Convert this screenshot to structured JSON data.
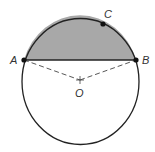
{
  "diagram": {
    "type": "circle-segment",
    "colors": {
      "stroke": "#222222",
      "segment_fill": "#a8a8a8",
      "label": "#333333",
      "background": "#ffffff"
    },
    "circle": {
      "cx": 80.5,
      "cy": 81.5,
      "rx": 58.5,
      "ry": 63
    },
    "points": {
      "A": {
        "label": "A",
        "x": 24,
        "y": 60
      },
      "B": {
        "label": "B",
        "x": 136,
        "y": 60
      },
      "C": {
        "label": "C",
        "x": 103,
        "y": 24
      },
      "O": {
        "label": "O",
        "x": 80,
        "y": 80
      }
    },
    "labels": {
      "A": "A",
      "B": "B",
      "C": "C",
      "O": "O"
    },
    "segments": [
      {
        "from": "A",
        "to": "B",
        "style": "solid",
        "name": "chord AB"
      },
      {
        "from": "A",
        "to": "O",
        "style": "dashed",
        "name": "radius OA"
      },
      {
        "from": "O",
        "to": "B",
        "style": "dashed",
        "name": "radius OB"
      }
    ],
    "shaded_region": "circular segment bounded by chord AB and arc ACB"
  }
}
